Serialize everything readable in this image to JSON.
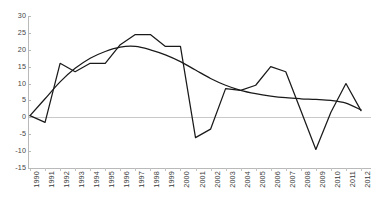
{
  "chart_data": {
    "type": "line",
    "title": "",
    "subtitle": "",
    "xlabel": "",
    "ylabel": "",
    "ylim": [
      -15,
      30
    ],
    "xlim": [
      1990,
      2012
    ],
    "yticks": [
      30,
      25,
      20,
      15,
      10,
      5,
      0,
      -5,
      -10,
      -15
    ],
    "ytick_labels": [
      "30",
      "25",
      "20",
      "15",
      "10",
      "5",
      "0",
      "-5",
      "-10",
      "-15"
    ],
    "grid": false,
    "legend": "none",
    "legend_position": "none",
    "zero_line": true,
    "categories": [
      "1990",
      "1991",
      "1992",
      "1993",
      "1994",
      "1995",
      "1996",
      "1997",
      "1998",
      "1999",
      "2000",
      "2001",
      "2002",
      "2003",
      "2004",
      "2005",
      "2006",
      "2007",
      "2008",
      "2009",
      "2010",
      "2011",
      "2012"
    ],
    "x": [
      1990,
      1991,
      1992,
      1993,
      1994,
      1995,
      1996,
      1997,
      1998,
      1999,
      2000,
      2001,
      2002,
      2003,
      2004,
      2005,
      2006,
      2007,
      2008,
      2009,
      2010,
      2011,
      2012
    ],
    "series": [
      {
        "name": "annual-series",
        "style": "jagged",
        "color": "#1a1a1a",
        "values": [
          0.5,
          -1.5,
          16.0,
          13.5,
          16.0,
          16.0,
          21.5,
          24.5,
          24.5,
          21.0,
          21.0,
          -6.0,
          -3.5,
          8.5,
          8.0,
          9.5,
          15.0,
          13.5,
          2.0,
          -9.5,
          1.5,
          10.0,
          2.0
        ]
      },
      {
        "name": "trend-series",
        "style": "smooth",
        "color": "#1a1a1a",
        "values": [
          0.5,
          5.5,
          10.5,
          14.5,
          17.5,
          19.5,
          20.8,
          21.0,
          20.0,
          18.5,
          16.5,
          14.0,
          11.5,
          9.5,
          8.0,
          7.0,
          6.3,
          5.8,
          5.5,
          5.3,
          5.0,
          4.2,
          2.2
        ]
      }
    ],
    "annotations": []
  }
}
